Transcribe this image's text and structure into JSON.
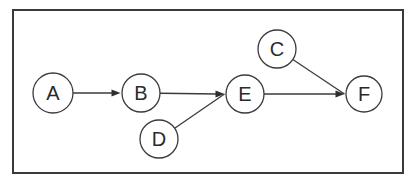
{
  "diagram": {
    "type": "directed-graph",
    "ink_color": "#3b3b3b",
    "text_color": "#2b2b2b",
    "background_color": "#ffffff",
    "frame": {
      "x": 13,
      "y": 10,
      "width": 390,
      "height": 163
    },
    "canvas": {
      "width": 410,
      "height": 182
    },
    "nodes": [
      {
        "id": "A",
        "label": "A",
        "x": 53,
        "y": 93,
        "r": 20
      },
      {
        "id": "B",
        "label": "B",
        "x": 141,
        "y": 93,
        "r": 19
      },
      {
        "id": "C",
        "label": "C",
        "x": 277,
        "y": 49,
        "r": 19
      },
      {
        "id": "D",
        "label": "D",
        "x": 159,
        "y": 139,
        "r": 19
      },
      {
        "id": "E",
        "label": "E",
        "x": 245,
        "y": 94,
        "r": 19
      },
      {
        "id": "F",
        "label": "F",
        "x": 364,
        "y": 94,
        "r": 18
      }
    ],
    "edges": [
      {
        "from": "A",
        "to": "B"
      },
      {
        "from": "B",
        "to": "E"
      },
      {
        "from": "D",
        "to": "E"
      },
      {
        "from": "C",
        "to": "F"
      },
      {
        "from": "E",
        "to": "F"
      }
    ]
  }
}
